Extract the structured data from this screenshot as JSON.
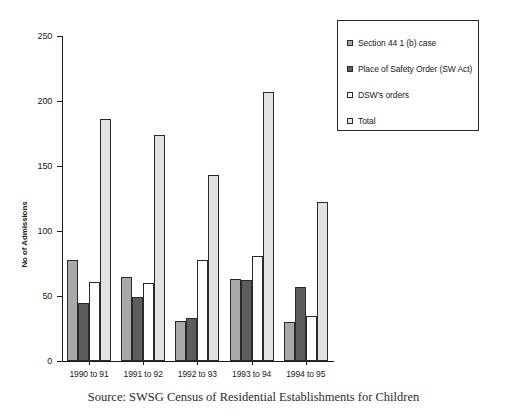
{
  "chart_data": {
    "type": "bar",
    "title": "",
    "xlabel": "",
    "ylabel": "No of Admissions",
    "ylim": [
      0,
      250
    ],
    "yticks": [
      0,
      50,
      100,
      150,
      200,
      250
    ],
    "grid": false,
    "legend_position": "top-right",
    "categories": [
      "1990 to 91",
      "1991 to 92",
      "1992 to 93",
      "1993 to 94",
      "1994 to 95"
    ],
    "series": [
      {
        "name": "Section 44 1 (b) case",
        "color": "#a8a8a8",
        "values": [
          78,
          65,
          31,
          63,
          30
        ]
      },
      {
        "name": "Place of Safety Order (SW Act)",
        "color": "#5d5d5d",
        "values": [
          45,
          49,
          33,
          62,
          57
        ]
      },
      {
        "name": "DSW's orders",
        "color": "#fdfdfd",
        "values": [
          61,
          60,
          78,
          81,
          35
        ]
      },
      {
        "name": "Total",
        "color": "#e2e2e2",
        "values": [
          186,
          174,
          143,
          207,
          122
        ]
      }
    ],
    "caption": "Source: SWSG Census of Residential Establishments for Children"
  }
}
